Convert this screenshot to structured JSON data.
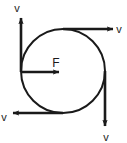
{
  "figure": {
    "type": "physics-free-body-diagram",
    "background_color": "#ffffff",
    "stroke_color": "#1a1a1a",
    "body": {
      "shape": "circle",
      "center_x": 63,
      "center_y": 71,
      "radius": 42,
      "stroke_width": 2
    },
    "force_vector": {
      "label": "F",
      "direction": "right",
      "start_x": 21,
      "start_y": 72,
      "end_x": 59,
      "end_y": 72,
      "label_x": 53,
      "label_y": 66
    },
    "velocity_vectors": [
      {
        "id": "top-left-up",
        "label": "v",
        "direction": "up",
        "tail_x": 21,
        "tail_y": 72,
        "head_x": 21,
        "head_y": 18,
        "label_x": 17,
        "label_y": 12
      },
      {
        "id": "top-right-right",
        "label": "v",
        "direction": "right",
        "tail_x": 63,
        "tail_y": 29,
        "head_x": 113,
        "head_y": 29,
        "label_x": 118,
        "label_y": 33
      },
      {
        "id": "bottom-right-down",
        "label": "v",
        "direction": "down",
        "tail_x": 105,
        "tail_y": 71,
        "head_x": 105,
        "head_y": 126,
        "label_x": 102,
        "label_y": 140
      },
      {
        "id": "bottom-left-left",
        "label": "v",
        "direction": "left",
        "tail_x": 63,
        "tail_y": 113,
        "head_x": 13,
        "head_y": 113,
        "label_x": 1,
        "label_y": 121
      }
    ]
  }
}
